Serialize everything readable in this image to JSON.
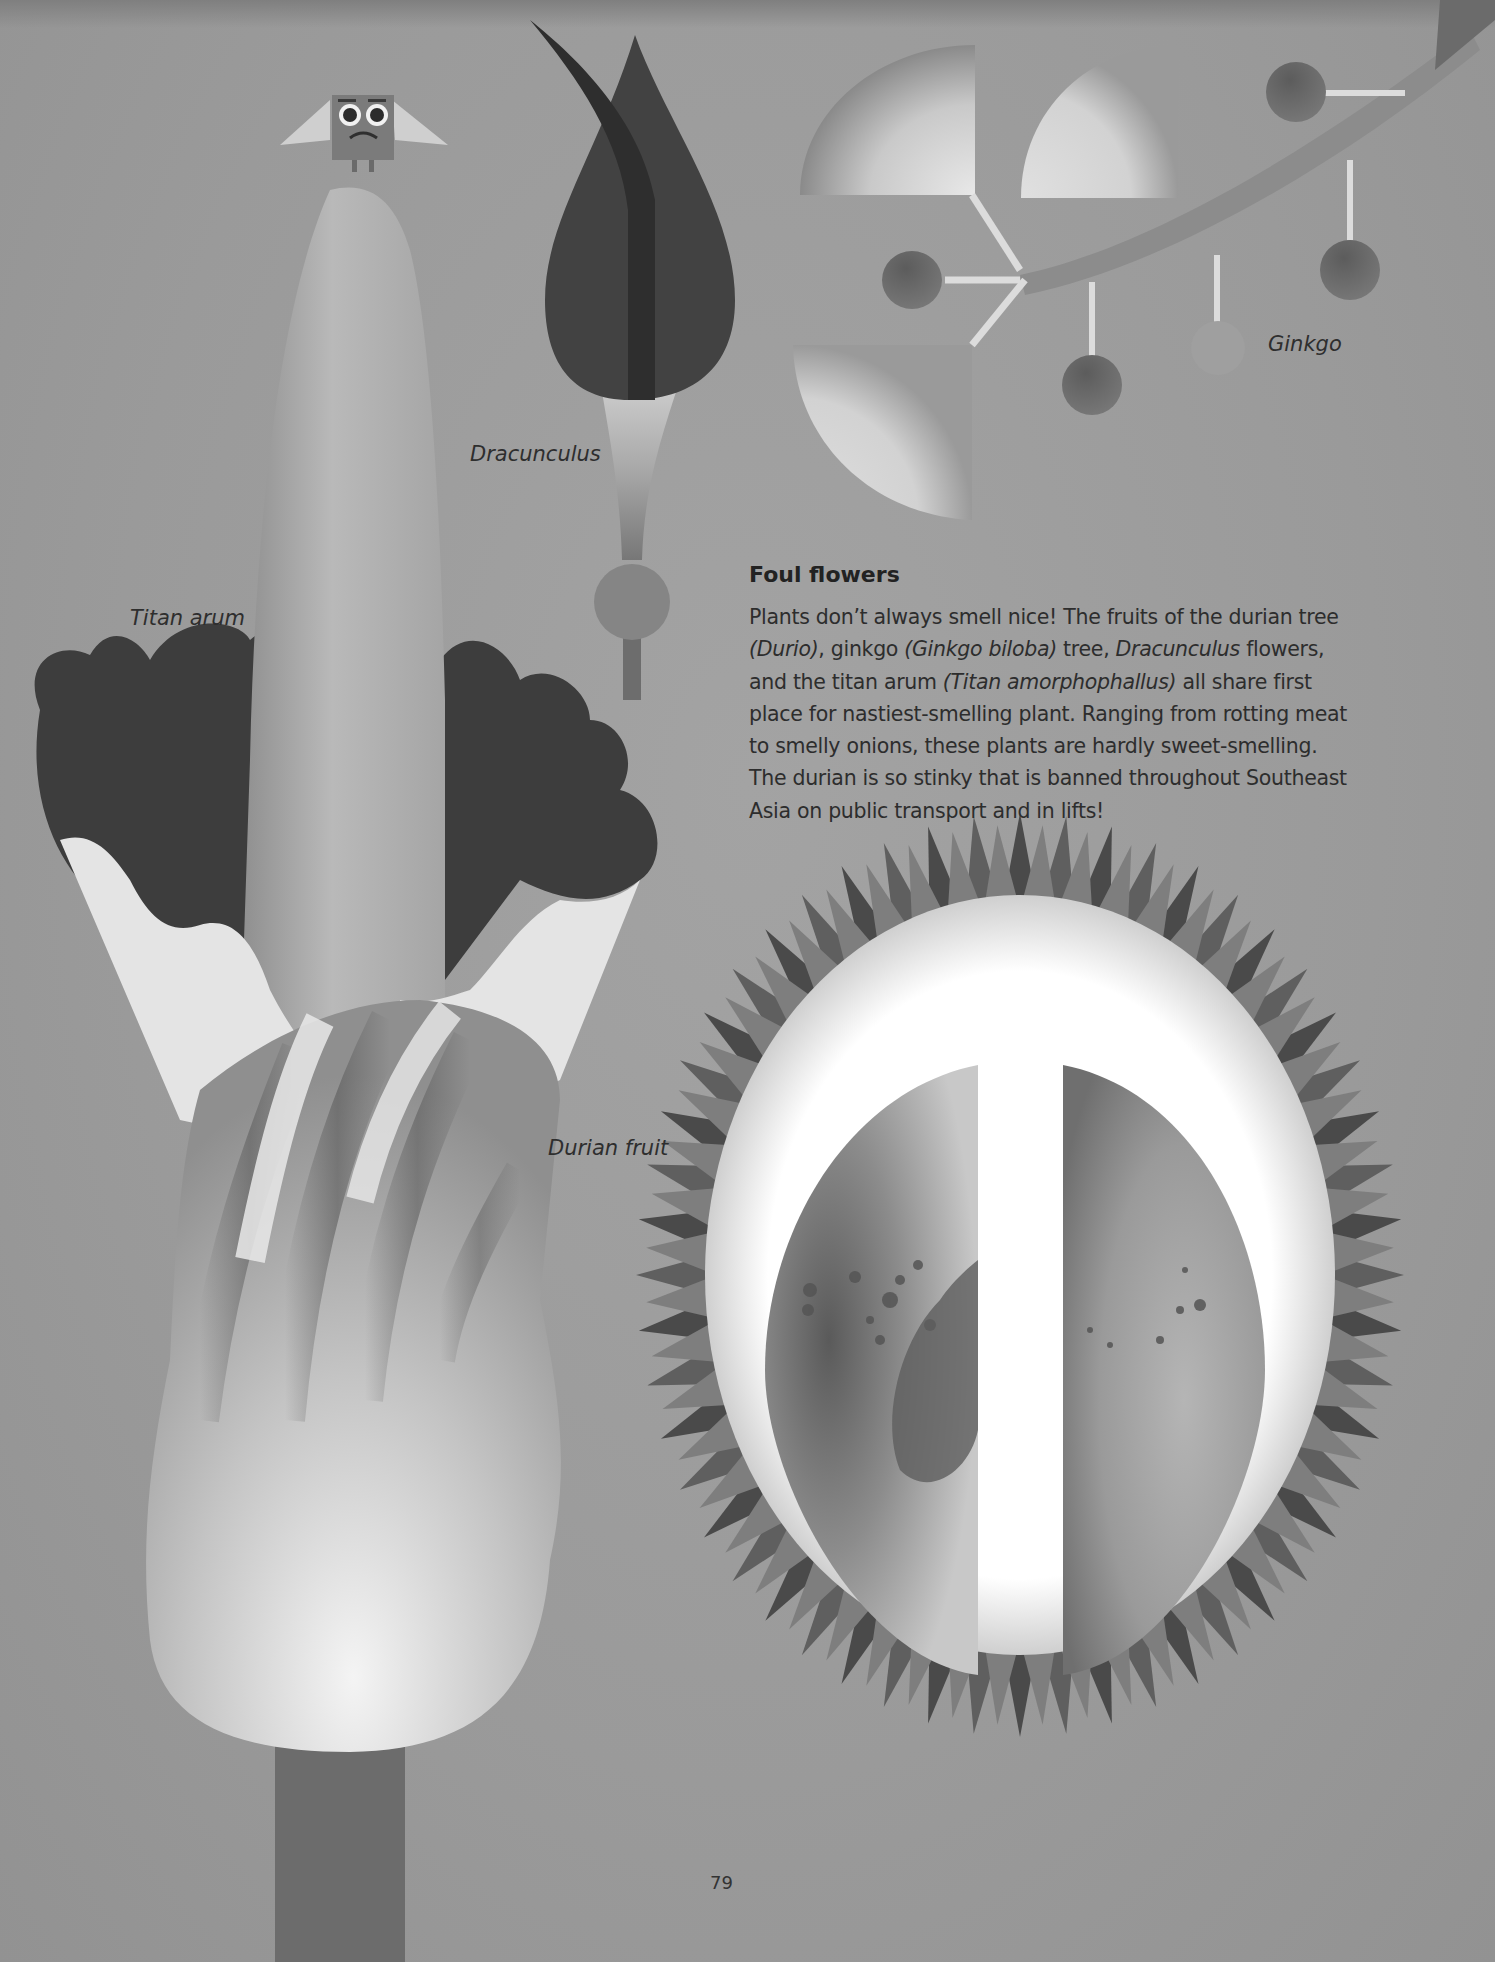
{
  "page": {
    "number": "79",
    "background_color": "#9c9c9c"
  },
  "article": {
    "title": "Foul flowers",
    "body": [
      {
        "text": "Plants don’t always smell nice! The fruits of the durian tree ",
        "italic": false
      },
      {
        "text": "(Durio)",
        "italic": true
      },
      {
        "text": ", ginkgo ",
        "italic": false
      },
      {
        "text": "(Ginkgo biloba)",
        "italic": true
      },
      {
        "text": " tree, ",
        "italic": false
      },
      {
        "text": "Dracunculus",
        "italic": true
      },
      {
        "text": " flowers, and the titan arum ",
        "italic": false
      },
      {
        "text": "(Titan amorphophallus)",
        "italic": true
      },
      {
        "text": " all share first place for nastiest-smelling plant. Ranging from rotting meat to smelly onions, these plants are hardly sweet-smelling. The durian is so stinky that is banned throughout Southeast Asia on public transport and in lifts!",
        "italic": false
      }
    ]
  },
  "illustrations": {
    "dracunculus": {
      "label": "Dracunculus"
    },
    "titan_arum": {
      "label": "Titan arum"
    },
    "ginkgo": {
      "label": "Ginkgo"
    },
    "durian": {
      "label": "Durian fruit"
    },
    "mascot": {
      "name": "square-faced character"
    }
  },
  "colors": {
    "dark": "#3c3c3c",
    "mid": "#6e6e6e",
    "light": "#d9d9d9",
    "white": "#f2f2f2",
    "text": "#2a2a2a"
  }
}
